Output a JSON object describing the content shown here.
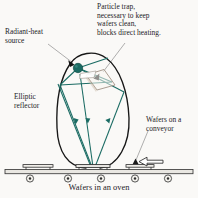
{
  "figure": {
    "title": "Wafers in an oven",
    "caption": "Wafers in an oven",
    "type": "schematic-cross-section",
    "colors": {
      "background": "#faf9f7",
      "ray": "#1a6b63",
      "source_fill": "#1a6b63",
      "reflector_outline": "#171717",
      "leader_line": "#8c8c8c",
      "trap_outline": "#9c8d7f",
      "conveyor_outline": "#3a3a3a",
      "text": "#23211f"
    }
  },
  "labels": {
    "particle_trap": "Particle trap,\nnecessary to keep\nwafers clean,\nblocks direct heating.",
    "radiant_heat_source": "Radiant-heat\nsource",
    "elliptic_reflector": "Elliptic\nreflector",
    "wafers_on_conveyor": "Wafers on a\nconveyor",
    "caption": "Wafers in an oven"
  },
  "components": {
    "radiant_heat_source": {
      "name": "radiant-heat source",
      "shape": "filled circle",
      "cx": 78,
      "cy": 68,
      "r": 4.6
    },
    "elliptic_reflector": {
      "name": "elliptic reflector",
      "shape": "open ellipse",
      "cx": 93,
      "cy": 110,
      "rx": 36,
      "ry": 58
    },
    "particle_trap": {
      "name": "particle trap",
      "shape": "thin parallelogram plate",
      "cx": 100,
      "cy": 76
    },
    "conveyor": {
      "name": "wafer conveyor belt",
      "belt_y": 171,
      "belt_left": 6,
      "belt_right": 192,
      "roller_count": 5,
      "wafer_count": 3
    },
    "rays": {
      "name": "radiant heat rays",
      "count_upward": 3,
      "count_downward": 3,
      "arrowheads_on_source": 2,
      "arrowheads_on_rays": 3
    },
    "feed_arrow": {
      "name": "conveyor feed direction arrow",
      "direction": "left",
      "x": 150,
      "y": 164
    }
  }
}
